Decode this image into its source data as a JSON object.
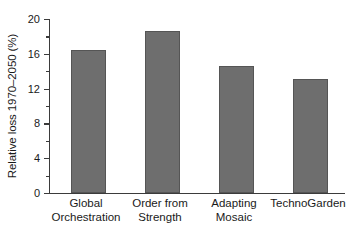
{
  "chart_data": {
    "type": "bar",
    "title": "",
    "xlabel": "",
    "ylabel": "Relative loss 1970–2050 (%)",
    "categories": [
      "Global Orchestration",
      "Order from Strength",
      "Adapting Mosaic",
      "TechnoGarden"
    ],
    "category_lines": [
      [
        "Global",
        "Orchestration"
      ],
      [
        "Order from",
        "Strength"
      ],
      [
        "Adapting",
        "Mosaic"
      ],
      [
        "TechnoGarden",
        ""
      ]
    ],
    "values": [
      16.4,
      18.6,
      14.6,
      13.1
    ],
    "ylim": [
      0,
      20
    ],
    "yticks": [
      0,
      4,
      8,
      12,
      16,
      20
    ],
    "ytick_labels": [
      "0",
      "4",
      "8",
      "12",
      "16",
      "20"
    ],
    "yminor_ticks": [
      2,
      6,
      10,
      14,
      18
    ],
    "grid": false,
    "legend": null,
    "bar_color": "#6e6e6e",
    "bar_edge_color": "#555555",
    "axis_color": "#3b3b3b",
    "background": "#ffffff"
  }
}
